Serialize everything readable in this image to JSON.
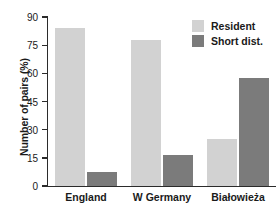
{
  "chart_data": {
    "type": "bar",
    "title": "",
    "xlabel": "",
    "ylabel": "Number of pairs (%)",
    "categories": [
      "England",
      "W Germany",
      "Białowieża"
    ],
    "series": [
      {
        "name": "Resident",
        "color": "#d2d2d2",
        "values": [
          84,
          78,
          25
        ]
      },
      {
        "name": "Short dist.",
        "color": "#7b7b7b",
        "values": [
          7.5,
          16.5,
          57.5
        ]
      }
    ],
    "ylim": [
      0,
      90
    ],
    "yticks": [
      0,
      15,
      30,
      45,
      60,
      75,
      90
    ],
    "ytick_labels": [
      "0",
      "15",
      "30",
      "45",
      "60",
      "75",
      "90"
    ],
    "grid": false,
    "legend_position": "top-right"
  },
  "axis": {
    "y_label": "Number of pairs (%)",
    "tick_0": "0",
    "tick_15": "15",
    "tick_30": "30",
    "tick_45": "45",
    "tick_60": "60",
    "tick_75": "75",
    "tick_90": "90"
  },
  "categories": {
    "c0": "England",
    "c1": "W Germany",
    "c2": "Białowieża"
  },
  "legend": {
    "resident_label": "Resident",
    "shortdist_label": "Short dist."
  },
  "colors": {
    "resident": "#d2d2d2",
    "short_dist": "#7b7b7b",
    "axis": "#2b2b2b",
    "text": "#1a1a1a",
    "background": "#ffffff"
  }
}
